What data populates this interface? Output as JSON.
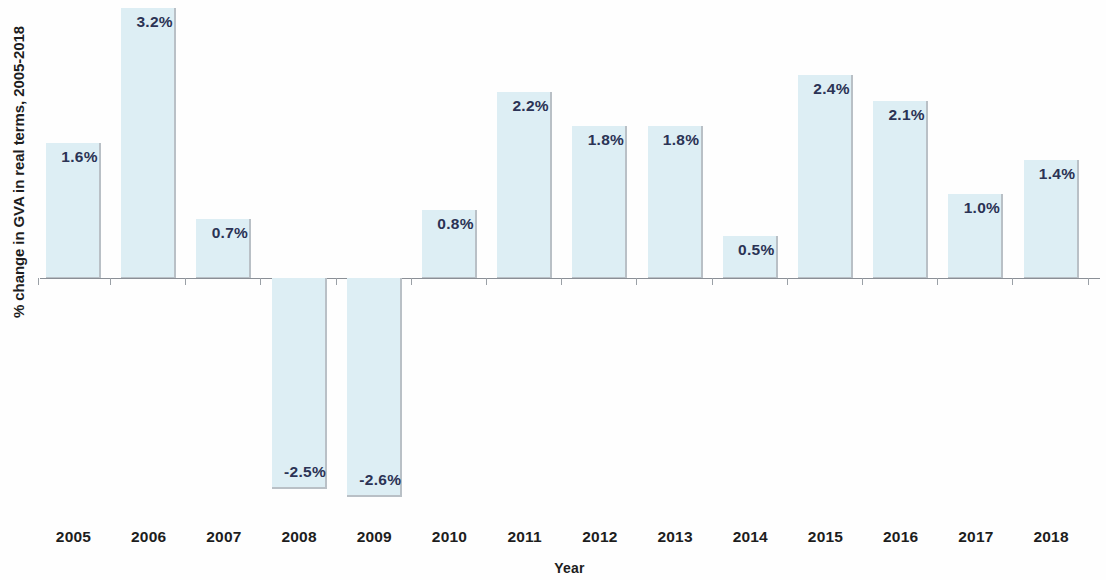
{
  "chart_data": {
    "type": "bar",
    "title": "",
    "xlabel": "Year",
    "ylabel": "% change in GVA in real terms, 2005-2018",
    "categories": [
      "2005",
      "2006",
      "2007",
      "2008",
      "2009",
      "2010",
      "2011",
      "2012",
      "2013",
      "2014",
      "2015",
      "2016",
      "2017",
      "2018"
    ],
    "values": [
      1.6,
      3.2,
      0.7,
      -2.5,
      -2.6,
      0.8,
      2.2,
      1.8,
      1.8,
      0.5,
      2.4,
      2.1,
      1.0,
      1.4
    ],
    "data_labels": [
      "1.6%",
      "3.2%",
      "0.7%",
      "-2.5%",
      "-2.6%",
      "0.8%",
      "2.2%",
      "1.8%",
      "1.8%",
      "0.5%",
      "2.4%",
      "2.1%",
      "1.0%",
      "1.4%"
    ],
    "ylim": [
      -2.8,
      3.3
    ],
    "grid": false,
    "legend": false,
    "axis_tick_labels_y": [],
    "bar_color": "#ddeef4",
    "bar_edge_color": "#b9c0c6",
    "label_color": "#2b3355",
    "axis_color": "#8a8f96",
    "background_color": "#fefefe"
  }
}
